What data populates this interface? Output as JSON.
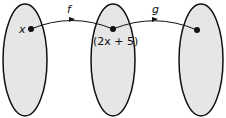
{
  "diagram": {
    "type": "function-composition-mapping",
    "sets": [
      "domain",
      "intermediate",
      "codomain"
    ],
    "points": {
      "input": "x",
      "intermediate": "(2x + 5)",
      "output": ""
    },
    "arrows": [
      {
        "label": "f",
        "from": "input",
        "to": "intermediate"
      },
      {
        "label": "g",
        "from": "intermediate",
        "to": "output"
      }
    ],
    "colors": {
      "set_fill": "#e6e6e6",
      "stroke": "#111111"
    }
  }
}
